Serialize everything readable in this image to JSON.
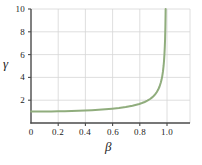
{
  "chart_data": {
    "type": "line",
    "title": "",
    "subtitle": "",
    "xlabel": "β",
    "ylabel": "γ",
    "xlim": [
      0.0,
      1.175
    ],
    "ylim": [
      0.0,
      10.0
    ],
    "grid": true,
    "legend": null,
    "xticks": [
      {
        "value": 0.0,
        "label": "0"
      },
      {
        "value": 0.2,
        "label": "0.2"
      },
      {
        "value": 0.4,
        "label": "0.4"
      },
      {
        "value": 0.6,
        "label": "0.6"
      },
      {
        "value": 0.8,
        "label": "0.8"
      },
      {
        "value": 1.0,
        "label": "1.0"
      }
    ],
    "yticks": [
      {
        "value": 0,
        "label": "0"
      },
      {
        "value": 2,
        "label": "2"
      },
      {
        "value": 4,
        "label": "4"
      },
      {
        "value": 6,
        "label": "6"
      },
      {
        "value": 8,
        "label": "8"
      },
      {
        "value": 10,
        "label": "10"
      }
    ],
    "series": [
      {
        "name": "lorentz-factor",
        "color": "#90ad7d",
        "linewidth": 2.0,
        "x": [
          0.0,
          0.05,
          0.1,
          0.15,
          0.2,
          0.25,
          0.3,
          0.35,
          0.4,
          0.45,
          0.5,
          0.55,
          0.6,
          0.65,
          0.7,
          0.75,
          0.8,
          0.82,
          0.84,
          0.86,
          0.88,
          0.9,
          0.91,
          0.92,
          0.93,
          0.94,
          0.95,
          0.96,
          0.965,
          0.97,
          0.975,
          0.98,
          0.983,
          0.986,
          0.989,
          0.991,
          0.993,
          0.9945,
          0.9955,
          0.996,
          0.9965,
          0.997,
          0.99749
        ],
        "y": [
          1.0,
          1.001,
          1.005,
          1.011,
          1.021,
          1.033,
          1.048,
          1.068,
          1.091,
          1.12,
          1.155,
          1.197,
          1.25,
          1.316,
          1.4,
          1.512,
          1.667,
          1.75,
          1.844,
          1.957,
          2.105,
          2.294,
          2.412,
          2.552,
          2.722,
          2.931,
          3.203,
          3.571,
          3.807,
          4.113,
          4.501,
          5.025,
          5.454,
          6.003,
          6.741,
          7.395,
          8.422,
          9.54,
          10.52,
          11.18,
          11.97,
          12.92,
          14.16
        ]
      }
    ],
    "annotations": []
  },
  "figure": {
    "background": "#ffffff",
    "axis_color": "#4a4a4a",
    "grid_color": "#d5d5d5",
    "tick_color": "#4a4a4a"
  }
}
